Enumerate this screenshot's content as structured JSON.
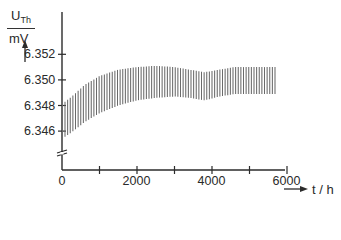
{
  "chart_data": {
    "type": "line",
    "title": "",
    "ylabel": {
      "symbol": "U",
      "subscript": "Th",
      "unit": "mV"
    },
    "xlabel": "t / h",
    "xlim": [
      0,
      6800
    ],
    "ylim": [
      6.3445,
      6.353
    ],
    "x_ticks": [
      0,
      1000,
      2000,
      3000,
      4000,
      5000,
      6000
    ],
    "x_tick_labels": [
      "0",
      "",
      "2000",
      "",
      "4000",
      "",
      "6000"
    ],
    "y_ticks": [
      6.346,
      6.348,
      6.35,
      6.352
    ],
    "y_tick_labels": [
      "6.346",
      "6.348",
      "6.350",
      "6.352"
    ],
    "axis_break": true,
    "grid": false,
    "legend": null,
    "series": [
      {
        "name": "U_Th oscillation envelope",
        "style": "dense vertical oscillation lines",
        "x": [
          0,
          300,
          600,
          1000,
          1500,
          2000,
          2500,
          3000,
          3400,
          3800,
          4200,
          4600,
          5000,
          5400,
          5700
        ],
        "upper": [
          6.3481,
          6.3488,
          6.3496,
          6.3503,
          6.3508,
          6.351,
          6.3511,
          6.351,
          6.3508,
          6.3506,
          6.3508,
          6.351,
          6.351,
          6.351,
          6.351
        ],
        "lower": [
          6.3454,
          6.346,
          6.3467,
          6.3474,
          6.348,
          6.3484,
          6.3486,
          6.3487,
          6.3486,
          6.3484,
          6.3487,
          6.3489,
          6.3489,
          6.3489,
          6.3489
        ]
      }
    ]
  },
  "axes": {
    "y_unit_symbol": "U",
    "y_unit_sub": "Th",
    "y_unit_denominator": "mV",
    "x_label": "t / h"
  }
}
